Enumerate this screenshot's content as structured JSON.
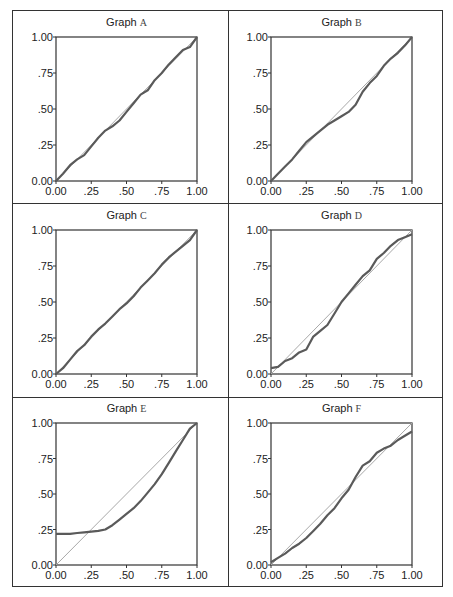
{
  "figure": {
    "panels": [
      {
        "title_prefix": "Graph",
        "label": "A"
      },
      {
        "title_prefix": "Graph",
        "label": "B"
      },
      {
        "title_prefix": "Graph",
        "label": "C"
      },
      {
        "title_prefix": "Graph",
        "label": "D"
      },
      {
        "title_prefix": "Graph",
        "label": "E"
      },
      {
        "title_prefix": "Graph",
        "label": "F"
      }
    ],
    "x_ticks": [
      "0.00",
      ".25",
      ".50",
      ".75",
      "1.00"
    ],
    "y_ticks": [
      "0.00",
      ".25",
      ".50",
      ".75",
      "1.00"
    ],
    "colors": {
      "curve": "#5a5a5a",
      "reference": "#a8a8a8",
      "axis": "#333333"
    }
  },
  "chart_data": [
    {
      "type": "line",
      "title": "Graph A",
      "xlim": [
        0,
        1
      ],
      "ylim": [
        0,
        1
      ],
      "grid": false,
      "x_ticks": [
        "0.00",
        ".25",
        ".50",
        ".75",
        "1.00"
      ],
      "y_ticks": [
        "0.00",
        ".25",
        ".50",
        ".75",
        "1.00"
      ],
      "series": [
        {
          "name": "reference",
          "x": [
            0,
            1
          ],
          "y": [
            0,
            1
          ]
        },
        {
          "name": "observed",
          "x": [
            0,
            0.05,
            0.1,
            0.15,
            0.2,
            0.25,
            0.3,
            0.35,
            0.4,
            0.45,
            0.5,
            0.55,
            0.6,
            0.65,
            0.7,
            0.75,
            0.8,
            0.85,
            0.9,
            0.95,
            1.0
          ],
          "y": [
            0,
            0.05,
            0.11,
            0.15,
            0.18,
            0.24,
            0.3,
            0.35,
            0.38,
            0.42,
            0.48,
            0.54,
            0.6,
            0.63,
            0.7,
            0.75,
            0.81,
            0.86,
            0.91,
            0.93,
            1.0
          ]
        }
      ]
    },
    {
      "type": "line",
      "title": "Graph B",
      "xlim": [
        0,
        1
      ],
      "ylim": [
        0,
        1
      ],
      "grid": false,
      "x_ticks": [
        "0.00",
        ".25",
        ".50",
        ".75",
        "1.00"
      ],
      "y_ticks": [
        "0.00",
        ".25",
        ".50",
        ".75",
        "1.00"
      ],
      "series": [
        {
          "name": "reference",
          "x": [
            0,
            1
          ],
          "y": [
            0,
            1
          ]
        },
        {
          "name": "observed",
          "x": [
            0,
            0.05,
            0.1,
            0.15,
            0.2,
            0.25,
            0.3,
            0.35,
            0.4,
            0.45,
            0.5,
            0.55,
            0.6,
            0.65,
            0.7,
            0.75,
            0.8,
            0.85,
            0.9,
            0.95,
            1.0
          ],
          "y": [
            0,
            0.05,
            0.1,
            0.15,
            0.21,
            0.27,
            0.31,
            0.35,
            0.39,
            0.42,
            0.45,
            0.48,
            0.53,
            0.62,
            0.68,
            0.73,
            0.8,
            0.85,
            0.89,
            0.94,
            1.0
          ]
        }
      ]
    },
    {
      "type": "line",
      "title": "Graph C",
      "xlim": [
        0,
        1
      ],
      "ylim": [
        0,
        1
      ],
      "grid": false,
      "x_ticks": [
        "0.00",
        ".25",
        ".50",
        ".75",
        "1.00"
      ],
      "y_ticks": [
        "0.00",
        ".25",
        ".50",
        ".75",
        "1.00"
      ],
      "series": [
        {
          "name": "reference",
          "x": [
            0,
            1
          ],
          "y": [
            0,
            1
          ]
        },
        {
          "name": "observed",
          "x": [
            0,
            0.05,
            0.1,
            0.15,
            0.2,
            0.25,
            0.3,
            0.35,
            0.4,
            0.45,
            0.5,
            0.55,
            0.6,
            0.65,
            0.7,
            0.75,
            0.8,
            0.85,
            0.9,
            0.95,
            1.0
          ],
          "y": [
            0,
            0.04,
            0.1,
            0.16,
            0.2,
            0.26,
            0.31,
            0.35,
            0.4,
            0.45,
            0.49,
            0.54,
            0.6,
            0.65,
            0.7,
            0.76,
            0.81,
            0.85,
            0.89,
            0.93,
            1.0
          ]
        }
      ]
    },
    {
      "type": "line",
      "title": "Graph D",
      "xlim": [
        0,
        1
      ],
      "ylim": [
        0,
        1
      ],
      "grid": false,
      "x_ticks": [
        "0.00",
        ".25",
        ".50",
        ".75",
        "1.00"
      ],
      "y_ticks": [
        "0.00",
        ".25",
        ".50",
        ".75",
        "1.00"
      ],
      "series": [
        {
          "name": "reference",
          "x": [
            0,
            1
          ],
          "y": [
            0,
            1
          ]
        },
        {
          "name": "observed",
          "x": [
            0,
            0.05,
            0.1,
            0.15,
            0.2,
            0.25,
            0.3,
            0.35,
            0.4,
            0.45,
            0.5,
            0.55,
            0.6,
            0.65,
            0.7,
            0.75,
            0.8,
            0.85,
            0.9,
            0.95,
            1.0
          ],
          "y": [
            0.04,
            0.05,
            0.09,
            0.11,
            0.15,
            0.17,
            0.26,
            0.3,
            0.34,
            0.42,
            0.5,
            0.56,
            0.62,
            0.68,
            0.72,
            0.8,
            0.84,
            0.89,
            0.93,
            0.95,
            0.97
          ]
        }
      ]
    },
    {
      "type": "line",
      "title": "Graph E",
      "xlim": [
        0,
        1
      ],
      "ylim": [
        0,
        1
      ],
      "grid": false,
      "x_ticks": [
        "0.00",
        ".25",
        ".50",
        ".75",
        "1.00"
      ],
      "y_ticks": [
        "0.00",
        ".25",
        ".50",
        ".75",
        "1.00"
      ],
      "series": [
        {
          "name": "reference",
          "x": [
            0,
            1
          ],
          "y": [
            0,
            1
          ]
        },
        {
          "name": "observed",
          "x": [
            0,
            0.05,
            0.1,
            0.15,
            0.2,
            0.25,
            0.3,
            0.35,
            0.4,
            0.45,
            0.5,
            0.55,
            0.6,
            0.65,
            0.7,
            0.75,
            0.8,
            0.85,
            0.9,
            0.95,
            1.0
          ],
          "y": [
            0.22,
            0.22,
            0.22,
            0.225,
            0.23,
            0.235,
            0.24,
            0.25,
            0.28,
            0.32,
            0.36,
            0.4,
            0.45,
            0.51,
            0.57,
            0.64,
            0.72,
            0.8,
            0.88,
            0.96,
            1.0
          ]
        }
      ]
    },
    {
      "type": "line",
      "title": "Graph F",
      "xlim": [
        0,
        1
      ],
      "ylim": [
        0,
        1
      ],
      "grid": false,
      "x_ticks": [
        "0.00",
        ".25",
        ".50",
        ".75",
        "1.00"
      ],
      "y_ticks": [
        "0.00",
        ".25",
        ".50",
        ".75",
        "1.00"
      ],
      "series": [
        {
          "name": "reference",
          "x": [
            0,
            1
          ],
          "y": [
            0,
            1
          ]
        },
        {
          "name": "observed",
          "x": [
            0,
            0.05,
            0.1,
            0.15,
            0.2,
            0.25,
            0.3,
            0.35,
            0.4,
            0.45,
            0.5,
            0.55,
            0.6,
            0.65,
            0.7,
            0.75,
            0.8,
            0.85,
            0.9,
            0.95,
            1.0
          ],
          "y": [
            0.02,
            0.05,
            0.08,
            0.12,
            0.15,
            0.19,
            0.24,
            0.29,
            0.35,
            0.4,
            0.47,
            0.53,
            0.62,
            0.7,
            0.73,
            0.79,
            0.82,
            0.84,
            0.88,
            0.91,
            0.94
          ]
        }
      ]
    }
  ]
}
